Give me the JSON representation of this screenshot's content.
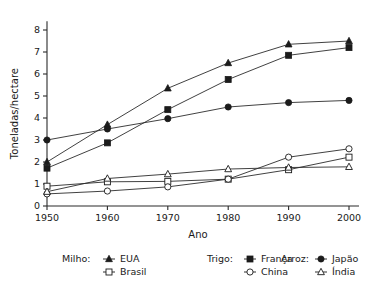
{
  "chart_data": {
    "type": "line",
    "title": "",
    "xlabel": "Ano",
    "ylabel": "Toneladas/hectare",
    "x": [
      1950,
      1960,
      1970,
      1980,
      1990,
      2000
    ],
    "xtick_labels": [
      "1950",
      "1960",
      "1970",
      "1980",
      "1990",
      "2000"
    ],
    "ytick_labels": [
      "0",
      "1",
      "2",
      "3",
      "4",
      "5",
      "6",
      "7",
      "8"
    ],
    "yticks": [
      0,
      1,
      2,
      3,
      4,
      5,
      6,
      7,
      8
    ],
    "xlim": [
      1950,
      2000
    ],
    "ylim": [
      0,
      8.4
    ],
    "grid": false,
    "legend_position": "below",
    "series": [
      {
        "name": "EUA",
        "group": "Milho:",
        "marker": "filled-triangle",
        "values": [
          2.0,
          3.7,
          5.35,
          6.5,
          7.35,
          7.5
        ]
      },
      {
        "name": "Brasil",
        "group": "Milho:",
        "marker": "open-square",
        "values": [
          0.9,
          1.1,
          1.12,
          1.22,
          1.65,
          2.22
        ]
      },
      {
        "name": "França",
        "group": "Trigo:",
        "marker": "filled-square",
        "values": [
          1.72,
          2.87,
          4.38,
          5.75,
          6.85,
          7.2
        ]
      },
      {
        "name": "China",
        "group": "Trigo:",
        "marker": "open-circle",
        "values": [
          0.55,
          0.68,
          0.87,
          1.22,
          2.22,
          2.6
        ]
      },
      {
        "name": "Japão",
        "group": "Arroz:",
        "marker": "filled-circle",
        "values": [
          3.0,
          3.5,
          3.97,
          4.5,
          4.7,
          4.8
        ]
      },
      {
        "name": "Índia",
        "group": "Arroz:",
        "marker": "open-triangle",
        "values": [
          0.65,
          1.25,
          1.45,
          1.68,
          1.75,
          1.78
        ]
      }
    ]
  },
  "legend": {
    "groups": [
      {
        "label": "Milho:",
        "entries": [
          {
            "name": "EUA",
            "marker": "filled-triangle"
          },
          {
            "name": "Brasil",
            "marker": "open-square"
          }
        ]
      },
      {
        "label": "Trigo:",
        "entries": [
          {
            "name": "França",
            "marker": "filled-square"
          },
          {
            "name": "China",
            "marker": "open-circle"
          }
        ]
      },
      {
        "label": "Arroz:",
        "entries": [
          {
            "name": "Japão",
            "marker": "filled-circle"
          },
          {
            "name": "Índia",
            "marker": "open-triangle"
          }
        ]
      }
    ]
  },
  "colors": {
    "ink": "#1b1b1b",
    "axis": "#2b2b2b",
    "background": "#ffffff"
  }
}
